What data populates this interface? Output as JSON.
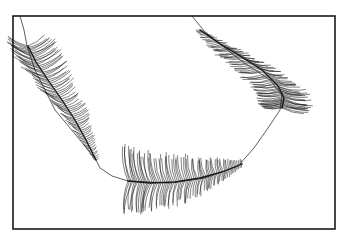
{
  "figure": {
    "width": 347,
    "height": 241,
    "background": "#ffffff",
    "ink": "#1a1a1a",
    "frame": {
      "x": 13,
      "y": 16,
      "w": 322,
      "h": 213,
      "stroke_width": 1.6
    },
    "connector": {
      "points": [
        [
          20,
          16
        ],
        [
          24,
          30
        ],
        [
          27,
          46
        ],
        [
          35,
          70
        ],
        [
          55,
          110
        ],
        [
          80,
          140
        ],
        [
          96,
          160
        ],
        [
          100,
          168
        ],
        [
          112,
          176
        ],
        [
          128,
          181
        ],
        [
          170,
          183
        ],
        [
          205,
          178
        ],
        [
          238,
          166
        ],
        [
          254,
          148
        ],
        [
          268,
          128
        ],
        [
          280,
          110
        ],
        [
          282,
          95
        ],
        [
          270,
          80
        ],
        [
          240,
          60
        ],
        [
          205,
          32
        ],
        [
          192,
          16
        ]
      ],
      "stroke_width": 0.7
    },
    "feathers": [
      {
        "name": "left-feather",
        "rachis": [
          [
            28,
            46
          ],
          [
            36,
            62
          ],
          [
            48,
            80
          ],
          [
            62,
            100
          ],
          [
            75,
            120
          ],
          [
            86,
            140
          ],
          [
            96,
            160
          ]
        ],
        "left_len": [
          22,
          26,
          24,
          20,
          14,
          8,
          3
        ],
        "right_len": [
          22,
          26,
          22,
          18,
          14,
          9,
          3
        ],
        "left_angle": 205,
        "right_angle": -30,
        "barbs": 70
      },
      {
        "name": "bottom-feather",
        "rachis": [
          [
            128,
            181
          ],
          [
            150,
            183
          ],
          [
            175,
            182
          ],
          [
            200,
            178
          ],
          [
            222,
            172
          ],
          [
            242,
            164
          ]
        ],
        "left_len": [
          34,
          30,
          26,
          20,
          12,
          4
        ],
        "right_len": [
          32,
          28,
          24,
          18,
          10,
          3
        ],
        "left_angle": -100,
        "right_angle": 100,
        "barbs": 70
      },
      {
        "name": "right-feather",
        "rachis": [
          [
            200,
            30
          ],
          [
            220,
            44
          ],
          [
            240,
            56
          ],
          [
            262,
            70
          ],
          [
            278,
            86
          ],
          [
            284,
            98
          ],
          [
            282,
            108
          ]
        ],
        "left_len": [
          4,
          12,
          18,
          22,
          24,
          24,
          20
        ],
        "right_len": [
          3,
          10,
          16,
          20,
          24,
          26,
          24
        ],
        "left_angle": 175,
        "right_angle": 10,
        "barbs": 70
      }
    ]
  }
}
